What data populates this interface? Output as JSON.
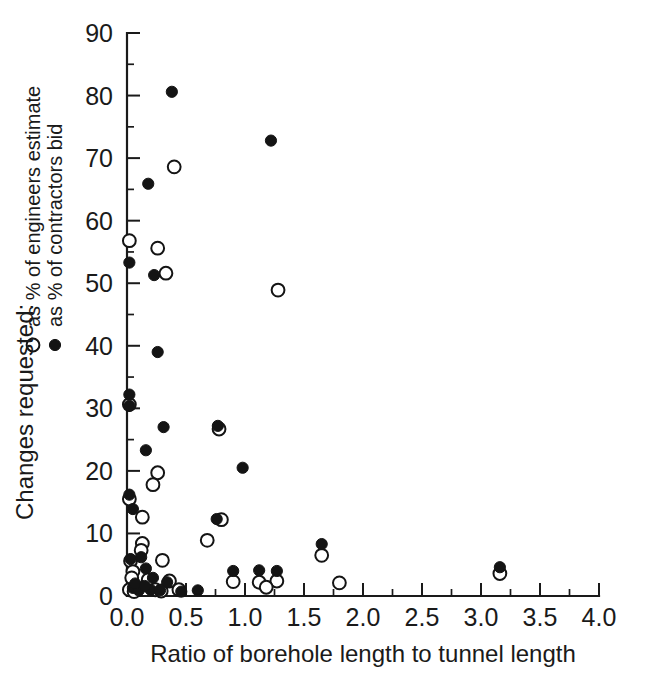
{
  "chart_data": {
    "type": "scatter",
    "title": "",
    "xlabel": "Ratio of borehole length to tunnel length",
    "ylabel": "Changes requested:",
    "xlim": [
      0.0,
      4.0
    ],
    "ylim": [
      0,
      90
    ],
    "xticks": [
      "0.0",
      "0.5",
      "1.0",
      "1.5",
      "2.0",
      "2.5",
      "3.0",
      "3.5",
      "4.0"
    ],
    "xtick_values": [
      0.0,
      0.5,
      1.0,
      1.5,
      2.0,
      2.5,
      3.0,
      3.5,
      4.0
    ],
    "yticks": [
      "0",
      "10",
      "20",
      "30",
      "40",
      "50",
      "60",
      "70",
      "80",
      "90"
    ],
    "ytick_values": [
      0,
      10,
      20,
      30,
      40,
      50,
      60,
      70,
      80,
      90
    ],
    "x_minor_step": 0.25,
    "y_minor_step": 5,
    "grid": false,
    "legend_position": "left-outside",
    "series": [
      {
        "name": "as % of engineers estimate",
        "marker": "open-circle",
        "color": "#141414",
        "points": [
          [
            0.02,
            56.8
          ],
          [
            0.26,
            55.6
          ],
          [
            0.4,
            68.6
          ],
          [
            0.33,
            51.6
          ],
          [
            1.28,
            48.9
          ],
          [
            0.02,
            30.6
          ],
          [
            0.78,
            26.7
          ],
          [
            0.26,
            19.7
          ],
          [
            0.22,
            17.8
          ],
          [
            0.02,
            15.5
          ],
          [
            0.13,
            12.6
          ],
          [
            0.13,
            8.4
          ],
          [
            0.12,
            7.3
          ],
          [
            0.8,
            12.2
          ],
          [
            0.68,
            8.9
          ],
          [
            0.3,
            5.7
          ],
          [
            0.03,
            5.6
          ],
          [
            0.05,
            3.9
          ],
          [
            0.04,
            2.9
          ],
          [
            0.18,
            2.6
          ],
          [
            0.36,
            2.4
          ],
          [
            0.9,
            2.3
          ],
          [
            1.12,
            2.2
          ],
          [
            1.27,
            2.4
          ],
          [
            1.18,
            1.4
          ],
          [
            1.8,
            2.1
          ],
          [
            1.65,
            6.5
          ],
          [
            3.16,
            3.6
          ],
          [
            0.02,
            1.0
          ],
          [
            0.09,
            1.2
          ],
          [
            0.24,
            1.0
          ],
          [
            0.06,
            0.7
          ],
          [
            0.44,
            1.0
          ],
          [
            0.29,
            0.8
          ]
        ]
      },
      {
        "name": "as % of contractors bid",
        "marker": "filled-circle",
        "color": "#141414",
        "points": [
          [
            0.02,
            53.3
          ],
          [
            0.18,
            65.9
          ],
          [
            0.38,
            80.6
          ],
          [
            0.23,
            51.3
          ],
          [
            1.22,
            72.8
          ],
          [
            0.02,
            32.2
          ],
          [
            0.02,
            30.4
          ],
          [
            0.26,
            39.0
          ],
          [
            0.16,
            23.3
          ],
          [
            0.31,
            27.0
          ],
          [
            0.77,
            27.2
          ],
          [
            0.76,
            12.3
          ],
          [
            0.98,
            20.5
          ],
          [
            0.02,
            16.2
          ],
          [
            0.05,
            13.9
          ],
          [
            0.03,
            5.9
          ],
          [
            0.12,
            6.2
          ],
          [
            0.16,
            4.4
          ],
          [
            0.22,
            2.9
          ],
          [
            0.34,
            2.2
          ],
          [
            0.9,
            4.0
          ],
          [
            1.12,
            4.1
          ],
          [
            1.27,
            4.0
          ],
          [
            1.65,
            8.3
          ],
          [
            3.16,
            4.6
          ],
          [
            0.05,
            1.3
          ],
          [
            0.1,
            0.9
          ],
          [
            0.2,
            1.0
          ],
          [
            0.28,
            0.9
          ],
          [
            0.46,
            0.7
          ],
          [
            0.6,
            0.9
          ],
          [
            0.07,
            2.0
          ],
          [
            0.15,
            1.6
          ]
        ]
      }
    ]
  },
  "legend": {
    "title": "Changes requested:",
    "entries": [
      {
        "marker": "open-circle",
        "label": "as % of engineers estimate"
      },
      {
        "marker": "filled-circle",
        "label": "as % of contractors bid"
      }
    ]
  }
}
